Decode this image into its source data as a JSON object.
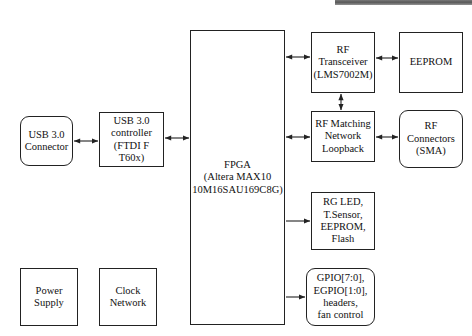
{
  "diagram": {
    "background_color": "#ffffff",
    "line_color": "#222222",
    "text_color": "#111111",
    "nodes": [
      {
        "id": "usb-connector",
        "label": "USB 3.0\nConnector",
        "shape": "rounded-rect",
        "x": 20,
        "y": 116,
        "w": 53,
        "h": 50,
        "font_size": 10.5
      },
      {
        "id": "usb-controller",
        "label": "USB 3.0\ncontroller\n(FTDI F T60x)",
        "shape": "rect",
        "x": 99,
        "y": 112,
        "w": 65,
        "h": 55,
        "font_size": 10.5
      },
      {
        "id": "fpga",
        "label": "FPGA\n(Altera MAX10\n10M16SAU169C8G)",
        "shape": "rect",
        "x": 190,
        "y": 30,
        "w": 95,
        "h": 295,
        "font_size": 10.5
      },
      {
        "id": "rf-transceiver",
        "label": "RF\nTransceiver\n(LMS7002M)",
        "shape": "rect",
        "x": 311,
        "y": 32,
        "w": 64,
        "h": 61,
        "font_size": 10.5
      },
      {
        "id": "eeprom",
        "label": "EEPROM",
        "shape": "rect",
        "x": 399,
        "y": 32,
        "w": 64,
        "h": 61,
        "font_size": 10.5
      },
      {
        "id": "rf-matching",
        "label": "RF Matching\nNetwork\nLoopback",
        "shape": "rect",
        "x": 311,
        "y": 111,
        "w": 64,
        "h": 51,
        "font_size": 10.5
      },
      {
        "id": "rf-connectors",
        "label": "RF\nConnectors\n(SMA)",
        "shape": "rounded-rect",
        "x": 399,
        "y": 110,
        "w": 64,
        "h": 58,
        "font_size": 10.5
      },
      {
        "id": "peripherals",
        "label": "RG LED,\nT.Sensor,\nEEPROM,\nFlash",
        "shape": "rect",
        "x": 311,
        "y": 192,
        "w": 64,
        "h": 58,
        "font_size": 10.5
      },
      {
        "id": "gpio",
        "label": "GPIO[7:0],\nEGPIO[1:0],\nheaders,\nfan control",
        "shape": "rounded-rect",
        "x": 306,
        "y": 268,
        "w": 69,
        "h": 58,
        "font_size": 10.5
      },
      {
        "id": "power-supply",
        "label": "Power\nSupply",
        "shape": "rect",
        "x": 20,
        "y": 268,
        "w": 58,
        "h": 58,
        "font_size": 10.5
      },
      {
        "id": "clock-network",
        "label": "Clock\nNetwork",
        "shape": "rect",
        "x": 99,
        "y": 268,
        "w": 58,
        "h": 58,
        "font_size": 10.5
      }
    ],
    "connections": [
      {
        "id": "usb-connector-to-controller",
        "from": "usb-connector",
        "to": "usb-controller",
        "orientation": "horizontal",
        "arrows": "both",
        "x1": 74,
        "y1": 141,
        "x2": 98,
        "y2": 141
      },
      {
        "id": "usb-controller-to-fpga",
        "from": "usb-controller",
        "to": "fpga",
        "orientation": "horizontal",
        "arrows": "both",
        "x1": 165,
        "y1": 138,
        "x2": 189,
        "y2": 138
      },
      {
        "id": "fpga-to-rf-transceiver",
        "from": "fpga",
        "to": "rf-transceiver",
        "orientation": "horizontal",
        "arrows": "both",
        "x1": 286,
        "y1": 57,
        "x2": 310,
        "y2": 57
      },
      {
        "id": "rf-transceiver-to-eeprom",
        "from": "rf-transceiver",
        "to": "eeprom",
        "orientation": "horizontal",
        "arrows": "both",
        "x1": 376,
        "y1": 58,
        "x2": 398,
        "y2": 58
      },
      {
        "id": "rf-transceiver-to-rf-matching",
        "from": "rf-transceiver",
        "to": "rf-matching",
        "orientation": "vertical",
        "arrows": "both",
        "x1": 341,
        "y1": 94,
        "x2": 341,
        "y2": 110
      },
      {
        "id": "fpga-to-rf-matching",
        "from": "fpga",
        "to": "rf-matching",
        "orientation": "horizontal",
        "arrows": "both",
        "x1": 286,
        "y1": 137,
        "x2": 310,
        "y2": 137
      },
      {
        "id": "rf-matching-to-rf-connectors",
        "from": "rf-matching",
        "to": "rf-connectors",
        "orientation": "horizontal",
        "arrows": "both",
        "x1": 376,
        "y1": 137,
        "x2": 398,
        "y2": 137
      },
      {
        "id": "fpga-to-peripherals",
        "from": "fpga",
        "to": "peripherals",
        "orientation": "horizontal",
        "arrows": "end",
        "x1": 286,
        "y1": 221,
        "x2": 310,
        "y2": 221
      },
      {
        "id": "fpga-to-gpio",
        "from": "fpga",
        "to": "gpio",
        "orientation": "horizontal",
        "arrows": "end",
        "x1": 286,
        "y1": 297,
        "x2": 305,
        "y2": 297
      }
    ],
    "artifacts": [
      {
        "id": "top-scan-bar",
        "x": 335,
        "y": 0,
        "w": 137,
        "h": 5
      }
    ]
  }
}
